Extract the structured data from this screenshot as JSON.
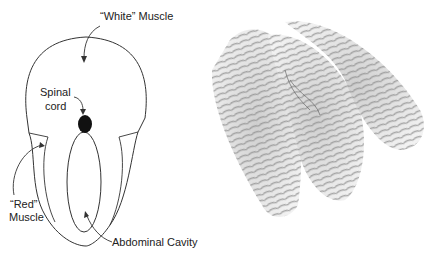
{
  "diagram": {
    "labels": {
      "white_muscle": "“White” Muscle",
      "spinal_line1": "Spinal",
      "spinal_line2": "cord",
      "red_line1": "“Red”",
      "red_line2": "Muscle",
      "abdominal": "Abdominal Cavity"
    },
    "colors": {
      "line": "#333333",
      "text": "#222222",
      "spinal_cord": "#111111"
    }
  },
  "photo": {
    "subject": "fish-fillets",
    "tone": "grayscale"
  }
}
